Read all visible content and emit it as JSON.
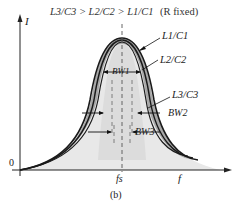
{
  "header": {
    "condition": "L3/C3 > L2/C2 > L1/C1",
    "note": "(R fixed)"
  },
  "axes": {
    "y_label": "I",
    "x_label": "f",
    "origin_label": "0",
    "center_label": "fs"
  },
  "curves": [
    {
      "label": "L1/C1",
      "bandwidth": "BW1",
      "note": "narrowest, highest peak"
    },
    {
      "label": "L2/C2",
      "bandwidth": "BW2"
    },
    {
      "label": "L3/C3",
      "bandwidth": "BW3",
      "note": "widest"
    }
  ],
  "caption": "(b)",
  "colors": {
    "curve": "#1a1a1a",
    "band_fill": "#9a9a9a",
    "inner_fill": "#d8d8d8",
    "under_fill": "#e6e6e6"
  }
}
